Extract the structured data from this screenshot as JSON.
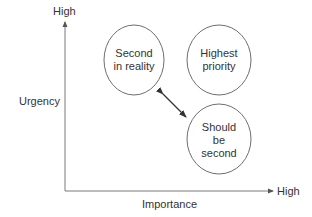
{
  "diagram": {
    "type": "priority-matrix",
    "y_axis": {
      "label": "Urgency",
      "end_label": "High"
    },
    "x_axis": {
      "label": "Importance",
      "end_label": "High"
    },
    "nodes": [
      {
        "id": "second-in-reality",
        "text": "Second\nin reality",
        "quadrant": "high-urgency-low-importance"
      },
      {
        "id": "highest-priority",
        "text": "Highest\npriority",
        "quadrant": "high-urgency-high-importance"
      },
      {
        "id": "should-be-second",
        "text": "Should\nbe\nsecond",
        "quadrant": "low-urgency-high-importance"
      }
    ],
    "edges": [
      {
        "from": "second-in-reality",
        "to": "should-be-second",
        "type": "double-arrow"
      }
    ],
    "colors": {
      "line": "#6e6e6e",
      "text": "#333333",
      "arrow": "#333333",
      "background": "#ffffff"
    }
  }
}
